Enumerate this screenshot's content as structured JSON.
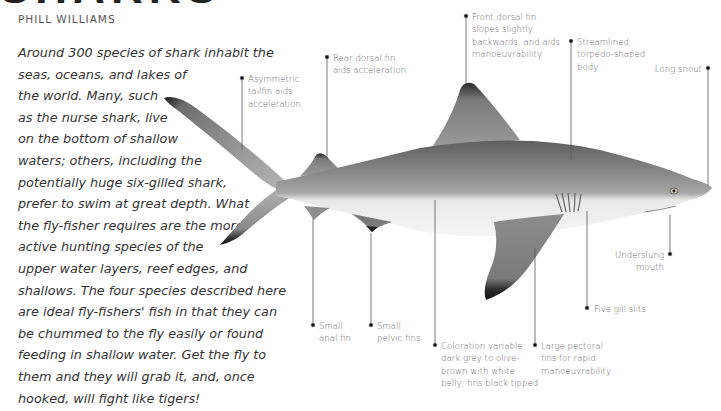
{
  "header": {
    "title": "SHARKS",
    "author": "PHILL WILLIAMS"
  },
  "intro": {
    "lines": [
      "Around 300 species of shark inhabit the",
      "seas, oceans, and lakes of",
      "the world. Many, such",
      "as the nurse shark, live",
      "on the bottom of shallow",
      "waters; others, including the",
      "potentially huge six-gilled shark,",
      "prefer to swim at great depth. What",
      "the fly-fisher requires are the more",
      "active hunting species of the",
      "upper water layers, reef edges, and",
      "shallows. The four species described here",
      "are ideal fly-fishers' fish in that they can",
      "be chummed to the fly easily or found",
      "feeding in shallow water. Get the fly to",
      "them and they will grab it, and, once",
      "hooked, will fight like tigers!"
    ]
  },
  "illustration": {
    "subject": "shark-anatomy",
    "colors": {
      "body_dark": "#6a6a6a",
      "body_mid": "#9a9a9a",
      "belly": "#f2f2f0",
      "fin_tip": "#1a1a1a",
      "leader_line": "#555555"
    },
    "labels": {
      "tailfin": [
        "Asymmetric",
        "tailfin aids",
        "acceleration"
      ],
      "rear_dorsal": [
        "Rear dorsal fin",
        "aids acceleration"
      ],
      "front_dorsal": [
        "Front dorsal fin",
        "slopes slightly",
        "backwards, and aids",
        "manoeuvrability"
      ],
      "streamlined": [
        "Streamlined,",
        "torpedo-shaped",
        "body"
      ],
      "snout": [
        "Long snout"
      ],
      "mouth": [
        "Underslung",
        "mouth"
      ],
      "gills": [
        "Five gill slits"
      ],
      "anal_fin": [
        "Small",
        "anal fin"
      ],
      "pelvic_fins": [
        "Small",
        "pelvic fins"
      ],
      "coloration": [
        "Coloration variable:",
        "dark grey to olive-",
        "brown with white",
        "belly; fins black tipped"
      ],
      "pectoral": [
        "Large pectoral",
        "fins for rapid",
        "manoeuvrability"
      ]
    }
  }
}
